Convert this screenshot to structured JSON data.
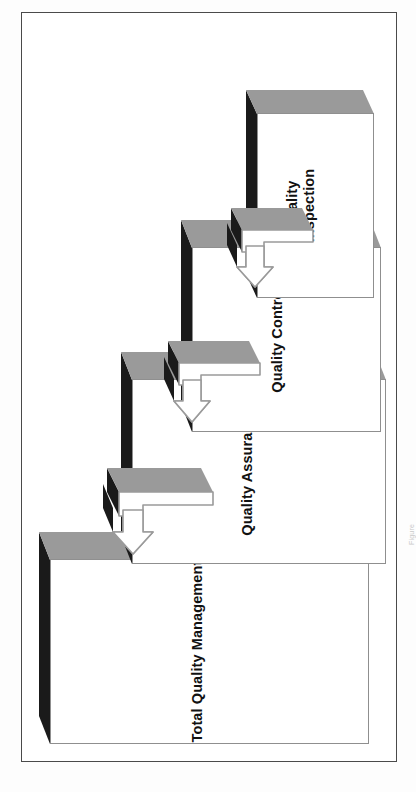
{
  "page": {
    "background_color": "#ffffff",
    "border_color": "#4a4a4a",
    "orientation": "rotated-90-ccw"
  },
  "colors": {
    "box_face": "#ffffff",
    "box_top_dark": "#1a1a1a",
    "box_side_gray": "#9a9a9a",
    "box_outline": "#8f8f8f",
    "arrow_fill": "#ffffff",
    "arrow_outline": "#9a9a9a",
    "arrow_top_dark": "#1a1a1a",
    "text": "#111111",
    "caption": "#c9c9c9"
  },
  "caption": {
    "text": "Figure"
  },
  "diagram": {
    "type": "staircase-3d-hierarchy",
    "title": "",
    "direction": "arrows point from narrower concept toward broader concept",
    "steps": [
      {
        "id": "total-quality-management",
        "label": "Total Quality Management",
        "level": 1,
        "scope": "broadest",
        "label_lines": [
          "Total Quality Management"
        ]
      },
      {
        "id": "quality-assurance",
        "label": "Quality Assurance",
        "level": 2,
        "scope": "broad",
        "label_lines": [
          "Quality Assurance"
        ]
      },
      {
        "id": "quality-control",
        "label": "Quality Control",
        "level": 3,
        "scope": "narrow",
        "label_lines": [
          "Quality Control"
        ]
      },
      {
        "id": "quality-inspection",
        "label": "Quality\nInspection",
        "level": 4,
        "scope": "narrowest",
        "label_lines": [
          "Quality",
          "Inspection"
        ]
      }
    ],
    "connectors": [
      {
        "id": "arrow-qa-to-tqm",
        "from": "quality-assurance",
        "to": "total-quality-management",
        "style": "3d-block-arrow"
      },
      {
        "id": "arrow-qc-to-qa",
        "from": "quality-control",
        "to": "quality-assurance",
        "style": "3d-block-arrow"
      },
      {
        "id": "arrow-qi-to-qc",
        "from": "quality-inspection",
        "to": "quality-control",
        "style": "3d-block-arrow"
      }
    ]
  }
}
